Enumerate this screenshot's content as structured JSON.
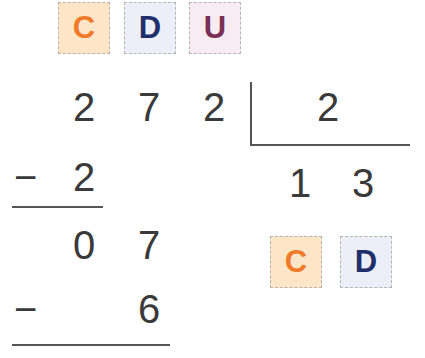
{
  "header_labels": [
    {
      "letter": "C",
      "text_color": "#ef7a2a",
      "bg_color": "#fde6c8"
    },
    {
      "letter": "D",
      "text_color": "#1f2f6b",
      "bg_color": "#eceef8"
    },
    {
      "letter": "U",
      "text_color": "#7b2f55",
      "bg_color": "#f6ecf2"
    }
  ],
  "division": {
    "dividend": [
      "2",
      "7",
      "2"
    ],
    "divisor": "2",
    "quotient": [
      "1",
      "3"
    ],
    "steps": [
      {
        "operator": "−",
        "digits": [
          "2"
        ]
      },
      {
        "remainder": [
          "0",
          "7"
        ]
      },
      {
        "operator": "−",
        "digits": [
          "6"
        ]
      }
    ]
  },
  "quotient_labels": [
    {
      "letter": "C",
      "text_color": "#ef7a2a",
      "bg_color": "#fde6c8"
    },
    {
      "letter": "D",
      "text_color": "#1f2f6b",
      "bg_color": "#eceef8"
    }
  ]
}
